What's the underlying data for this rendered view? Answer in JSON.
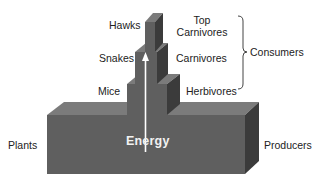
{
  "diagram": {
    "colors": {
      "front": "#5f5f5f",
      "top": "#7b7b7b",
      "side": "#3b3b3b",
      "arrow": "#ffffff",
      "text": "#222222"
    },
    "levels": [
      {
        "organism": "Plants",
        "role": "Producers"
      },
      {
        "organism": "Mice",
        "role": "Herbivores"
      },
      {
        "organism": "Snakes",
        "role": "Carnivores"
      },
      {
        "organism": "Hawks",
        "role_line1": "Top",
        "role_line2": "Carnivores"
      }
    ],
    "group_label": "Consumers",
    "arrow_label": "Energy"
  }
}
